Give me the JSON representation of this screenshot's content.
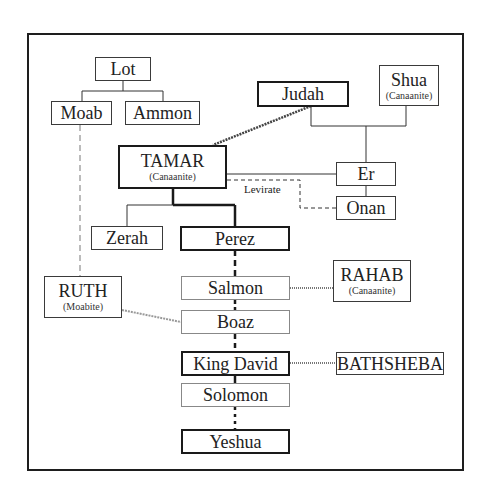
{
  "diagram": {
    "nodes": {
      "lot": {
        "name": "Lot"
      },
      "moab": {
        "name": "Moab"
      },
      "ammon": {
        "name": "Ammon"
      },
      "judah": {
        "name": "Judah"
      },
      "shua": {
        "name": "Shua",
        "note": "(Canaanite)"
      },
      "tamar": {
        "name": "TAMAR",
        "note": "(Canaanite)"
      },
      "er": {
        "name": "Er"
      },
      "onan": {
        "name": "Onan"
      },
      "zerah": {
        "name": "Zerah"
      },
      "perez": {
        "name": "Perez"
      },
      "ruth": {
        "name": "RUTH",
        "note": "(Moabite)"
      },
      "salmon": {
        "name": "Salmon"
      },
      "rahab": {
        "name": "RAHAB",
        "note": "(Canaanite)"
      },
      "boaz": {
        "name": "Boaz"
      },
      "king_david": {
        "name": "King David"
      },
      "bathsheba": {
        "name": "BATHSHEBA"
      },
      "solomon": {
        "name": "Solomon"
      },
      "yeshua": {
        "name": "Yeshua"
      }
    },
    "labels": {
      "levirate": "Levirate"
    },
    "edges": [
      {
        "from": "Lot",
        "to": "Moab",
        "type": "descent"
      },
      {
        "from": "Lot",
        "to": "Ammon",
        "type": "descent"
      },
      {
        "from": "Judah",
        "to": "Er",
        "type": "descent"
      },
      {
        "from": "Shua",
        "to": "Er",
        "type": "descent"
      },
      {
        "from": "Er",
        "to": "Onan",
        "type": "sibling"
      },
      {
        "from": "Judah",
        "to": "TAMAR",
        "type": "union-dotted"
      },
      {
        "from": "Er",
        "to": "TAMAR",
        "type": "marriage"
      },
      {
        "from": "Onan",
        "to": "TAMAR",
        "type": "levirate-dashed"
      },
      {
        "from": "TAMAR",
        "to": "Zerah",
        "type": "descent"
      },
      {
        "from": "TAMAR",
        "to": "Perez",
        "type": "descent-bold"
      },
      {
        "from": "Moab",
        "to": "RUTH",
        "type": "lineage-gray-dashed"
      },
      {
        "from": "Perez",
        "to": "Salmon",
        "type": "generations-dashed"
      },
      {
        "from": "RAHAB",
        "to": "Salmon",
        "type": "union-dotted"
      },
      {
        "from": "Salmon",
        "to": "Boaz",
        "type": "generations-dashed"
      },
      {
        "from": "RUTH",
        "to": "Boaz",
        "type": "union-dotted"
      },
      {
        "from": "Boaz",
        "to": "King David",
        "type": "generations-dashed"
      },
      {
        "from": "BATHSHEBA",
        "to": "King David",
        "type": "union-dotted"
      },
      {
        "from": "King David",
        "to": "Solomon",
        "type": "descent-bold"
      },
      {
        "from": "Solomon",
        "to": "Yeshua",
        "type": "generations-dotted"
      }
    ]
  }
}
